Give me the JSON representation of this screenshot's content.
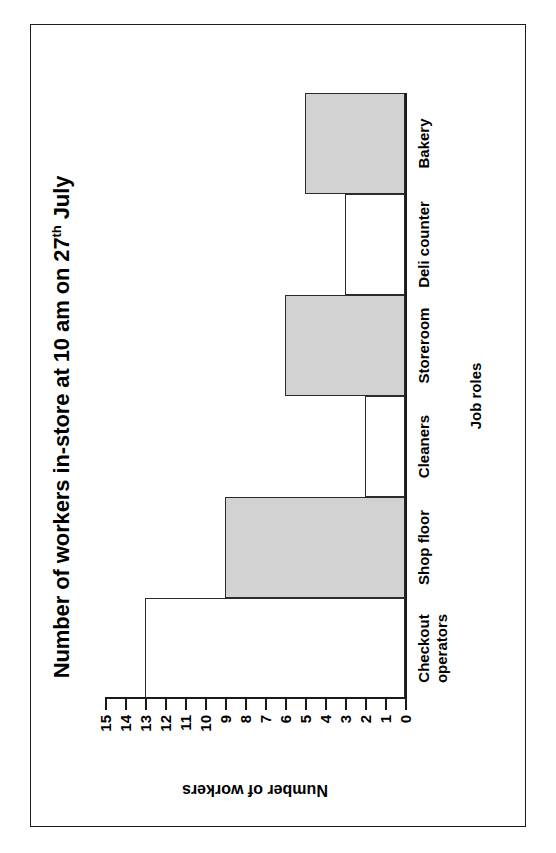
{
  "chart_data": {
    "type": "bar",
    "title": "Number of workers in-store at 10 am on 27th July",
    "title_main": "Number of workers in-store at 10 am on 27",
    "title_sup": "th",
    "title_tail": " July",
    "xlabel": "Job roles",
    "ylabel": "Number of workers",
    "categories": [
      "Checkout\noperators",
      "Shop floor",
      "Cleaners",
      "Storeroom",
      "Deli counter",
      "Bakery"
    ],
    "category_lines": [
      [
        "Checkout",
        "operators"
      ],
      [
        "Shop floor"
      ],
      [
        "Cleaners"
      ],
      [
        "Storeroom"
      ],
      [
        "Deli counter"
      ],
      [
        "Bakery"
      ]
    ],
    "values": [
      13,
      9,
      2,
      6,
      3,
      5
    ],
    "fills": [
      "hollow",
      "filled",
      "hollow",
      "filled",
      "hollow",
      "filled"
    ],
    "ylim": [
      0,
      15
    ],
    "yticks": [
      0,
      1,
      2,
      3,
      4,
      5,
      6,
      7,
      8,
      9,
      10,
      11,
      12,
      13,
      14,
      15
    ],
    "ytick_labels": [
      "0",
      "1",
      "2",
      "3",
      "4",
      "5",
      "6",
      "7",
      "8",
      "9",
      "10",
      "11",
      "12",
      "13",
      "14",
      "15"
    ],
    "grid": false,
    "legend": false,
    "bar_fill_color": "#d2d2d2",
    "bar_border_color": "#2b2b2b",
    "axis_color": "#1a1a1a",
    "background_color": "#ffffff",
    "orientation": "page-rotated-90-ccw"
  }
}
